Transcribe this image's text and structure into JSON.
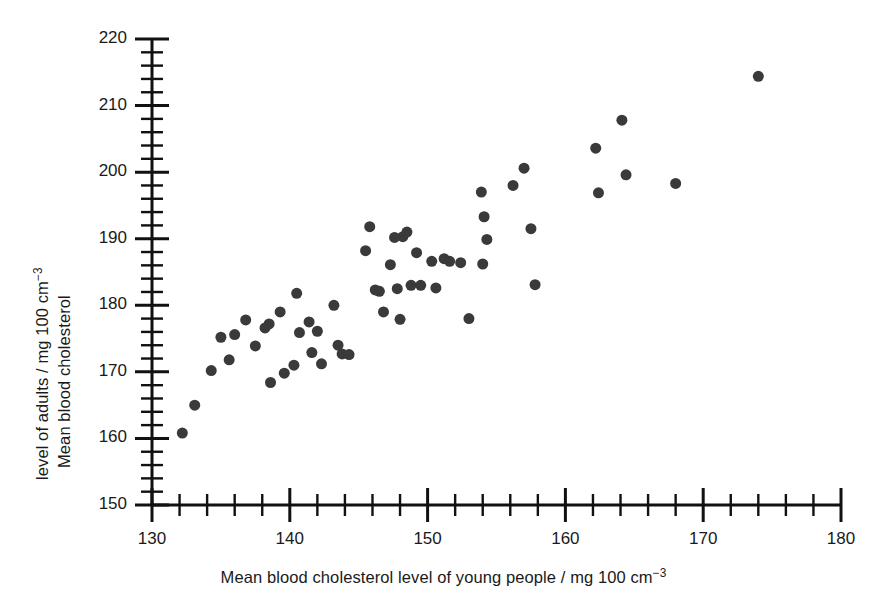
{
  "chart_data": {
    "type": "scatter",
    "title": "",
    "xlabel": "Mean blood cholesterol level of young people / mg 100 cm",
    "xlabel_exponent": "−3",
    "ylabel_line1": "Mean blood cholesterol",
    "ylabel_line2": "level of adults / mg 100 cm",
    "ylabel_exponent": "−3",
    "xlim": [
      130,
      180
    ],
    "ylim": [
      150,
      220
    ],
    "x_major_ticks": [
      130,
      140,
      150,
      160,
      170,
      180
    ],
    "y_major_ticks": [
      150,
      160,
      170,
      180,
      190,
      200,
      210,
      220
    ],
    "x_minor_interval": 2,
    "y_minor_interval": 2,
    "x_tick_labels": [
      "130",
      "140",
      "150",
      "160",
      "170",
      "180"
    ],
    "y_tick_labels": [
      "150",
      "160",
      "170",
      "180",
      "190",
      "200",
      "210",
      "220"
    ],
    "grid": false,
    "legend": false,
    "marker_color": "#3a3a3a",
    "marker_size": 11,
    "axis_color": "#111111",
    "points": [
      [
        132.2,
        160.8
      ],
      [
        133.1,
        165.0
      ],
      [
        134.3,
        170.2
      ],
      [
        135.0,
        175.2
      ],
      [
        135.6,
        171.8
      ],
      [
        136.0,
        175.6
      ],
      [
        136.8,
        177.8
      ],
      [
        137.5,
        173.9
      ],
      [
        138.5,
        177.2
      ],
      [
        138.2,
        176.6
      ],
      [
        138.6,
        168.4
      ],
      [
        139.3,
        179.0
      ],
      [
        139.6,
        169.8
      ],
      [
        140.5,
        181.8
      ],
      [
        140.7,
        175.9
      ],
      [
        140.3,
        171.0
      ],
      [
        141.4,
        177.5
      ],
      [
        141.6,
        172.9
      ],
      [
        142.0,
        176.1
      ],
      [
        142.3,
        171.2
      ],
      [
        143.2,
        180.0
      ],
      [
        143.5,
        174.0
      ],
      [
        143.8,
        172.7
      ],
      [
        144.3,
        172.6
      ],
      [
        145.5,
        188.2
      ],
      [
        145.8,
        191.8
      ],
      [
        146.2,
        182.3
      ],
      [
        146.5,
        182.1
      ],
      [
        146.8,
        179.0
      ],
      [
        147.3,
        186.1
      ],
      [
        147.6,
        190.2
      ],
      [
        147.8,
        182.5
      ],
      [
        148.2,
        190.3
      ],
      [
        148.5,
        191.0
      ],
      [
        148.0,
        177.9
      ],
      [
        148.8,
        183.0
      ],
      [
        149.2,
        187.9
      ],
      [
        149.5,
        183.0
      ],
      [
        150.3,
        186.6
      ],
      [
        150.6,
        182.6
      ],
      [
        151.2,
        187.0
      ],
      [
        151.6,
        186.6
      ],
      [
        152.4,
        186.4
      ],
      [
        153.0,
        178.0
      ],
      [
        153.9,
        197.0
      ],
      [
        154.1,
        193.3
      ],
      [
        154.3,
        189.9
      ],
      [
        154.0,
        186.2
      ],
      [
        156.2,
        198.0
      ],
      [
        157.0,
        200.6
      ],
      [
        157.5,
        191.5
      ],
      [
        157.8,
        183.1
      ],
      [
        162.2,
        203.6
      ],
      [
        162.4,
        196.9
      ],
      [
        164.1,
        207.8
      ],
      [
        164.4,
        199.6
      ],
      [
        168.0,
        198.3
      ],
      [
        174.0,
        214.4
      ]
    ]
  }
}
